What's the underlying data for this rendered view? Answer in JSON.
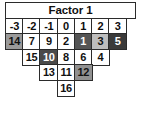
{
  "figure": {
    "kind": "pyramid-table",
    "title": "Factor 1",
    "column_headers": [
      "-3",
      "-2",
      "-1",
      "0",
      "1",
      "2",
      "3"
    ],
    "colors": {
      "border": "#2b2b2b",
      "cell_white": "#ffffff",
      "cell_light_gray": "#bdbdbd",
      "cell_medium_gray": "#9a9a9a",
      "cell_dark_gray": "#555555",
      "cell_darker_gray": "#4a4a4a",
      "cell_black_gray": "#3a3a3a",
      "text_dark": "#111111",
      "text_light": "#ffffff"
    },
    "rows": [
      {
        "offset": 0,
        "cells": [
          {
            "value": "14",
            "fill": "#9a9a9a",
            "text": "#111111"
          },
          {
            "value": "7",
            "fill": "#ffffff",
            "text": "#111111"
          },
          {
            "value": "9",
            "fill": "#ffffff",
            "text": "#111111"
          },
          {
            "value": "2",
            "fill": "#ffffff",
            "text": "#111111"
          },
          {
            "value": "1",
            "fill": "#555555",
            "text": "#ffffff"
          },
          {
            "value": "3",
            "fill": "#bdbdbd",
            "text": "#111111"
          },
          {
            "value": "5",
            "fill": "#3a3a3a",
            "text": "#ffffff"
          }
        ]
      },
      {
        "offset": 1,
        "cells": [
          {
            "value": "15",
            "fill": "#ffffff",
            "text": "#111111"
          },
          {
            "value": "10",
            "fill": "#4a4a4a",
            "text": "#ffffff"
          },
          {
            "value": "8",
            "fill": "#ffffff",
            "text": "#111111"
          },
          {
            "value": "6",
            "fill": "#ffffff",
            "text": "#111111"
          },
          {
            "value": "4",
            "fill": "#ffffff",
            "text": "#111111"
          }
        ]
      },
      {
        "offset": 2,
        "cells": [
          {
            "value": "13",
            "fill": "#ffffff",
            "text": "#111111"
          },
          {
            "value": "11",
            "fill": "#ffffff",
            "text": "#111111"
          },
          {
            "value": "12",
            "fill": "#919191",
            "text": "#111111"
          }
        ]
      },
      {
        "offset": 3,
        "cells": [
          {
            "value": "16",
            "fill": "#ffffff",
            "text": "#111111"
          }
        ]
      }
    ]
  }
}
